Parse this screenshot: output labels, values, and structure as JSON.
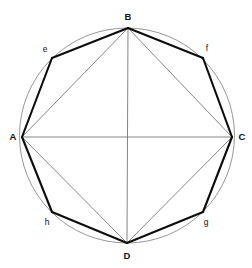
{
  "figure": {
    "background_color": "#ffffff",
    "circle": {
      "name": "circumscribing-circle",
      "cx": 127,
      "cy": 135.5,
      "r": 107.5,
      "stroke_color": "#8a8a8a",
      "stroke_width": 0.9
    },
    "styles": {
      "octagon_stroke_color": "#0d0d0d",
      "octagon_stroke_width": 2.1,
      "square_stroke_color": "#6f6f6f",
      "square_stroke_width": 0.85,
      "axis_stroke_color": "#6f6f6f",
      "axis_stroke_width": 0.85,
      "label_color": "#101010"
    },
    "vertices": [
      {
        "id": "A",
        "label": "A",
        "kind": "major",
        "x": 22,
        "y": 137,
        "label_x": 13,
        "label_y": 137
      },
      {
        "id": "B",
        "label": "B",
        "kind": "major",
        "x": 128,
        "y": 28,
        "label_x": 128,
        "label_y": 17
      },
      {
        "id": "C",
        "label": "C",
        "kind": "major",
        "x": 232,
        "y": 137,
        "label_x": 242,
        "label_y": 137
      },
      {
        "id": "D",
        "label": "D",
        "kind": "major",
        "x": 127,
        "y": 243,
        "label_x": 127,
        "label_y": 256
      },
      {
        "id": "e",
        "label": "e",
        "kind": "minor",
        "x": 52,
        "y": 58,
        "label_x": 45,
        "label_y": 49
      },
      {
        "id": "f",
        "label": "f",
        "kind": "minor",
        "x": 203,
        "y": 58,
        "label_x": 207,
        "label_y": 48
      },
      {
        "id": "g",
        "label": "g",
        "kind": "minor",
        "x": 203,
        "y": 212,
        "label_x": 206,
        "label_y": 222
      },
      {
        "id": "h",
        "label": "h",
        "kind": "minor",
        "x": 52,
        "y": 212,
        "label_x": 47,
        "label_y": 222
      }
    ],
    "octagon_edges": [
      {
        "from": "A",
        "to": "e"
      },
      {
        "from": "e",
        "to": "B"
      },
      {
        "from": "B",
        "to": "f"
      },
      {
        "from": "f",
        "to": "C"
      },
      {
        "from": "C",
        "to": "g"
      },
      {
        "from": "g",
        "to": "D"
      },
      {
        "from": "D",
        "to": "h"
      },
      {
        "from": "h",
        "to": "A"
      }
    ],
    "square_edges": [
      {
        "from": "A",
        "to": "B"
      },
      {
        "from": "B",
        "to": "C"
      },
      {
        "from": "C",
        "to": "D"
      },
      {
        "from": "D",
        "to": "A"
      }
    ],
    "axis_edges": [
      {
        "from": "A",
        "to": "C"
      },
      {
        "from": "B",
        "to": "D"
      }
    ]
  }
}
